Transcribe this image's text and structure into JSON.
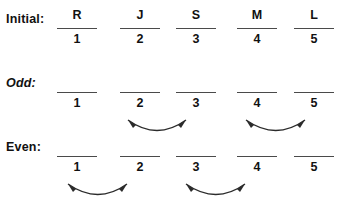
{
  "figure": {
    "background_color": "#ffffff",
    "ink_color": "#1a1a1a",
    "rule_color": "#4a4a4a",
    "arrow_color": "#2b2b2b"
  },
  "rows": [
    {
      "id": "initial",
      "label": "Initial:",
      "label_style": "bold",
      "top_values": [
        "R",
        "J",
        "S",
        "M",
        "L"
      ],
      "indices": [
        "1",
        "2",
        "3",
        "4",
        "5"
      ],
      "arrows": []
    },
    {
      "id": "odd",
      "label": "Odd:",
      "label_style": "italic",
      "top_values": [
        "",
        "",
        "",
        "",
        ""
      ],
      "indices": [
        "1",
        "2",
        "3",
        "4",
        "5"
      ],
      "arrows": [
        {
          "from": "2",
          "to": "3",
          "direction": "double"
        },
        {
          "from": "4",
          "to": "5",
          "direction": "double"
        }
      ]
    },
    {
      "id": "even",
      "label": "Even:",
      "label_style": "bold",
      "top_values": [
        "",
        "",
        "",
        "",
        ""
      ],
      "indices": [
        "1",
        "2",
        "3",
        "4",
        "5"
      ],
      "arrows": [
        {
          "from": "1",
          "to": "2",
          "direction": "double"
        },
        {
          "from": "3",
          "to": "4",
          "direction": "double"
        }
      ]
    }
  ]
}
